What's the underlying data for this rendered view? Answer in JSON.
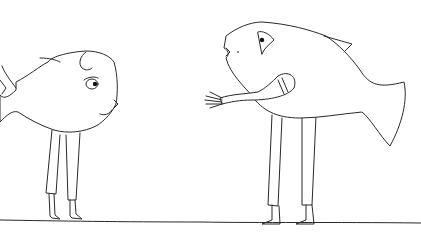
{
  "scene": {
    "description": "Line drawing of two fish-headed characters with human legs standing on the ground facing each other",
    "background_color": "#ffffff",
    "ink_color": "#2a2a2a",
    "characters": [
      {
        "name": "left-fish-person",
        "facing": "right",
        "expression": "frowning"
      },
      {
        "name": "right-fish-person",
        "facing": "left",
        "gesture": "reaching out hand"
      }
    ]
  }
}
